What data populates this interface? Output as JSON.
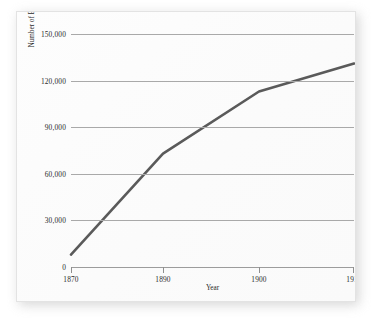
{
  "chart_data": {
    "type": "line",
    "title": "",
    "xlabel": "Year",
    "ylabel": "Number of Black Farm Owners",
    "x": [
      1870,
      1890,
      1900,
      1910
    ],
    "series": [
      {
        "name": "Number of Black Farm Owners",
        "values": [
          8000,
          73000,
          113000,
          131000
        ],
        "color": "#5a5a5a"
      }
    ],
    "xlim": [
      1870,
      1910
    ],
    "ylim": [
      0,
      150000
    ],
    "xticks": [
      1870,
      1890,
      1900,
      1910
    ],
    "xtick_labels": [
      "1870",
      "1890",
      "1900",
      "1910"
    ],
    "yticks": [
      0,
      30000,
      60000,
      90000,
      120000,
      150000
    ],
    "ytick_labels": [
      "0",
      "30,000",
      "60,000",
      "90,000",
      "120,000",
      "150,000"
    ],
    "grid": "horizontal",
    "legend": "none",
    "xtick_positions_px": [
      0,
      92,
      188,
      283
    ],
    "grid_color": "#a9a9a9",
    "axis_color": "#9c9c9c",
    "plot_background": "#fbfbfb",
    "card_background": "#ffffff"
  },
  "axes": {
    "x_title": "Year",
    "y_title": "Number of Black Farm Owners"
  },
  "ticks": {
    "y": [
      {
        "label": "150,000",
        "value": 150000
      },
      {
        "label": "120,000",
        "value": 120000
      },
      {
        "label": "90,000",
        "value": 90000
      },
      {
        "label": "60,000",
        "value": 60000
      },
      {
        "label": "30,000",
        "value": 30000
      },
      {
        "label": "0",
        "value": 0
      }
    ],
    "x": [
      {
        "label": "1870",
        "value": 1870
      },
      {
        "label": "1890",
        "value": 1890
      },
      {
        "label": "1900",
        "value": 1900
      },
      {
        "label": "1910",
        "value": 1910
      }
    ]
  }
}
